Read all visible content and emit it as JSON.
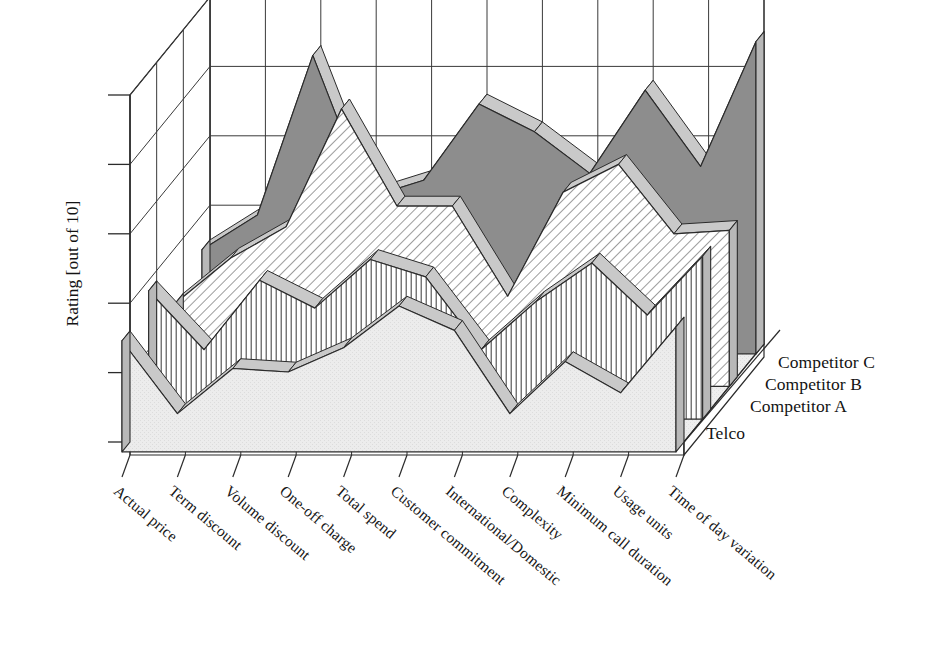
{
  "chart_data": {
    "type": "area",
    "style": "3d-ribbon-area",
    "title": "",
    "xlabel": "",
    "ylabel": "Rating [out of 10]",
    "ylim": [
      0,
      10
    ],
    "yticks": [
      0,
      2,
      4,
      6,
      8,
      10
    ],
    "ytick_labels": [
      "",
      "",
      "",
      "",
      "",
      ""
    ],
    "grid": true,
    "legend_position": "right-depth-axis",
    "categories": [
      "Actual price",
      "Term discount",
      "Volume discount",
      "One-off charge",
      "Total spend",
      "Customer commitment",
      "International/Domestic",
      "Complexity",
      "Minimum call duration",
      "Usage units",
      "Time of day variation"
    ],
    "series": [
      {
        "name": "Telco",
        "fill": "light-gray-stipple",
        "color": "#e9e9e9",
        "values": [
          3.2,
          1.1,
          2.4,
          2.3,
          3.0,
          4.2,
          3.5,
          1.1,
          2.6,
          1.7,
          3.6
        ]
      },
      {
        "name": "Competitor A",
        "fill": "vertical-hatch",
        "color": "#ffffff",
        "values": [
          3.7,
          2.0,
          4.0,
          3.2,
          4.6,
          4.1,
          2.0,
          3.4,
          4.5,
          3.0,
          4.7
        ]
      },
      {
        "name": "Competitor B",
        "fill": "diagonal-hatch",
        "color": "#ffffff",
        "values": [
          2.4,
          3.7,
          4.6,
          8.0,
          5.2,
          5.2,
          2.6,
          5.6,
          6.4,
          4.4,
          4.5
        ]
      },
      {
        "name": "Competitor C",
        "fill": "solid-dark-gray",
        "color": "#8d8d8d",
        "values": [
          3.0,
          4.0,
          8.6,
          4.5,
          5.0,
          7.2,
          6.4,
          5.2,
          7.6,
          5.4,
          9.0
        ]
      }
    ]
  },
  "axes": {
    "y_axis_label": "Rating [out of 10]",
    "tick_count": 6
  },
  "legend": {
    "items": [
      {
        "label": "Competitor C"
      },
      {
        "label": "Competitor B"
      },
      {
        "label": "Competitor A"
      },
      {
        "label": "Telco"
      }
    ]
  },
  "colors": {
    "outline": "#2b2b2b",
    "grid": "#3a3a3a",
    "telco_fill": "#e9e9e9",
    "compC_fill": "#8d8d8d",
    "top_face": "#c9c9c9",
    "side_face": "#b8b8b8",
    "background": "#ffffff"
  }
}
